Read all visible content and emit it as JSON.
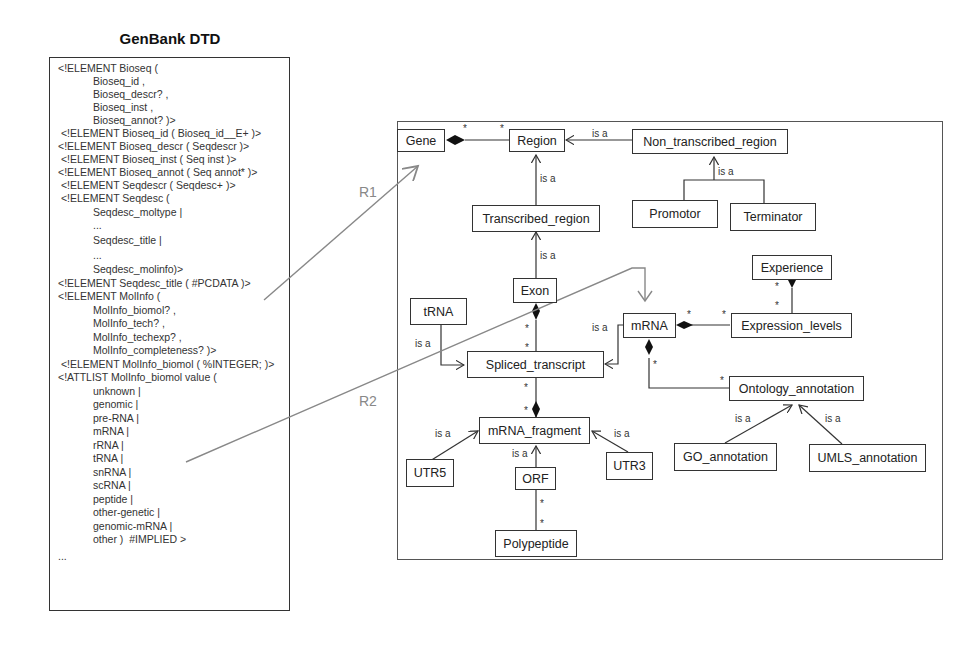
{
  "dtd": {
    "title": "GenBank DTD",
    "lines": [
      "<!ELEMENT Bioseq (",
      "            Bioseq_id ,",
      "            Bioseq_descr? ,",
      "            Bioseq_inst ,",
      "            Bioseq_annot? )>",
      " <!ELEMENT Bioseq_id ( Bioseq_id__E+ )>",
      "<!ELEMENT Bioseq_descr ( Seqdescr )>",
      " <!ELEMENT Bioseq_inst ( Seq inst )>",
      "<!ELEMENT Bioseq_annot ( Seq annot* )>",
      " <!ELEMENT Seqdescr ( Seqdesc+ )>",
      " <!ELEMENT Seqdesc (",
      "            Seqdesc_moltype |",
      "            ...",
      "            Seqdesc_title |",
      "            ...",
      "            Seqdesc_molinfo)>",
      "<!ELEMENT Seqdesc_title ( #PCDATA )>",
      "<!ELEMENT MolInfo (",
      "            MolInfo_biomol? ,",
      "            MolInfo_tech? ,",
      "            MolInfo_techexp? ,",
      "            MolInfo_completeness? )>",
      " <!ELEMENT MolInfo_biomol ( %INTEGER; )>",
      "<!ATTLIST MolInfo_biomol value (",
      "            unknown |",
      "            genomic |",
      "            pre-RNA |",
      "            mRNA |",
      "            rRNA |",
      "            tRNA |",
      "            snRNA |",
      "            scRNA |",
      "            peptide |",
      "            other-genetic |",
      "            genomic-mRNA |",
      "            other )  #IMPLIED >",
      "...",
      ""
    ]
  },
  "relations": {
    "r1": "R1",
    "r2": "R2"
  },
  "uml": {
    "classes": {
      "gene": "Gene",
      "region": "Region",
      "non_transcribed_region": "Non_transcribed_region",
      "promotor": "Promotor",
      "terminator": "Terminator",
      "transcribed_region": "Transcribed_region",
      "exon": "Exon",
      "experience": "Experience",
      "trna": "tRNA",
      "mrna": "mRNA",
      "expression_levels": "Expression_levels",
      "spliced_transcript": "Spliced_transcript",
      "ontology_annotation": "Ontology_annotation",
      "mrna_fragment": "mRNA_fragment",
      "go_annotation": "GO_annotation",
      "umls_annotation": "UMLS_annotation",
      "utr5": "UTR5",
      "utr3": "UTR3",
      "orf": "ORF",
      "polypeptide": "Polypeptide"
    },
    "is_a_label": "is a",
    "multiplicity": "*"
  }
}
